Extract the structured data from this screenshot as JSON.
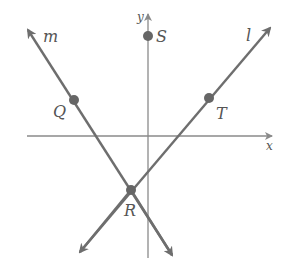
{
  "diagram": {
    "axes": {
      "x_label": "x",
      "y_label": "y"
    },
    "lines": [
      {
        "name": "m",
        "points": [
          "Q",
          "R"
        ]
      },
      {
        "name": "l",
        "points": [
          "R",
          "T"
        ]
      }
    ],
    "points": {
      "S": "S",
      "Q": "Q",
      "R": "R",
      "T": "T"
    },
    "line_labels": {
      "m": "m",
      "l": "l"
    },
    "colors": {
      "line": "#6e6e6e",
      "axis": "#8a8a8a",
      "point": "#666666",
      "label": "#555555"
    }
  }
}
